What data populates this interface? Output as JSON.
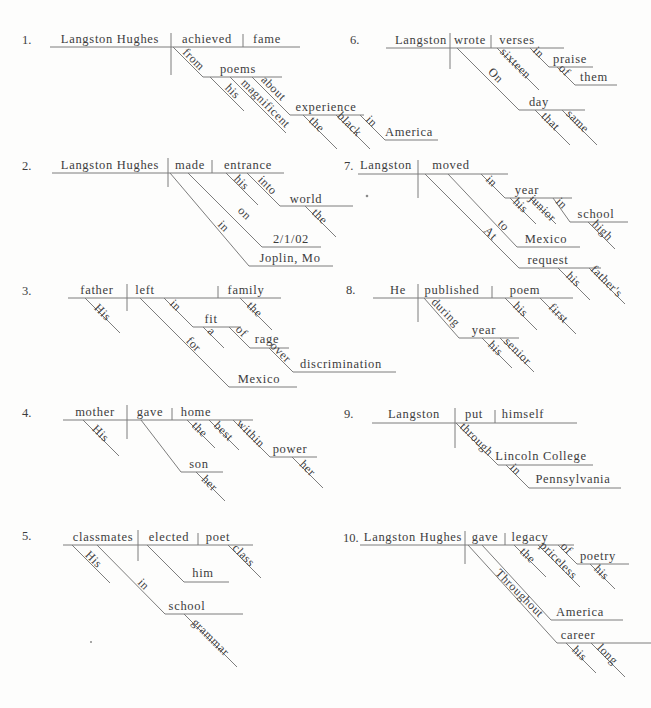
{
  "page": {
    "background": "#fdfdfc",
    "text_color": "#3c3c3c",
    "line_color": "#7d7d7d",
    "width": 651,
    "height": 708
  },
  "specks": [
    {
      "x": 367,
      "y": 196,
      "r": 1.3
    },
    {
      "x": 91,
      "y": 642,
      "r": 1.0
    }
  ],
  "diagrams": [
    {
      "number": "1.",
      "number_pos": [
        22,
        44
      ],
      "words": [
        [
          110,
          43,
          "Langston Hughes"
        ],
        [
          207,
          43,
          "achieved"
        ],
        [
          267,
          43,
          "fame"
        ],
        [
          238,
          73,
          "poems"
        ],
        [
          326,
          111,
          "experience"
        ],
        [
          409,
          136,
          "America"
        ]
      ],
      "slants": [
        [
          191,
          62,
          "from"
        ],
        [
          230,
          94,
          "his"
        ],
        [
          263,
          106,
          "magnificent"
        ],
        [
          271,
          91,
          "about"
        ],
        [
          314,
          127,
          "the"
        ],
        [
          347,
          127,
          "black"
        ],
        [
          369,
          124,
          "in"
        ]
      ],
      "lines": [
        [
          50,
          47,
          300,
          47
        ],
        [
          171,
          33,
          171,
          75
        ],
        [
          243,
          34,
          243,
          47
        ],
        [
          173,
          47,
          203,
          77
        ],
        [
          203,
          77,
          282,
          77
        ],
        [
          210,
          77,
          244,
          111
        ],
        [
          230,
          77,
          286,
          133
        ],
        [
          252,
          77,
          290,
          115
        ],
        [
          290,
          115,
          364,
          115
        ],
        [
          303,
          115,
          337,
          149
        ],
        [
          336,
          115,
          370,
          149
        ],
        [
          360,
          115,
          385,
          140
        ],
        [
          385,
          140,
          438,
          140
        ]
      ]
    },
    {
      "number": "2.",
      "number_pos": [
        22,
        170
      ],
      "words": [
        [
          110,
          169,
          "Langston Hughes"
        ],
        [
          190,
          169,
          "made"
        ],
        [
          248,
          169,
          "entrance"
        ],
        [
          306,
          203,
          "world"
        ],
        [
          291,
          243,
          "2/1/02"
        ],
        [
          290,
          262,
          "Joplin, Mo"
        ]
      ],
      "slants": [
        [
          239,
          185,
          "his"
        ],
        [
          265,
          188,
          "into"
        ],
        [
          317,
          219,
          "the"
        ],
        [
          242,
          216,
          "on"
        ],
        [
          221,
          229,
          "in"
        ]
      ],
      "lines": [
        [
          52,
          173,
          284,
          173
        ],
        [
          168,
          158,
          168,
          187
        ],
        [
          212,
          160,
          212,
          173
        ],
        [
          226,
          173,
          258,
          205
        ],
        [
          247,
          173,
          280,
          206
        ],
        [
          280,
          206,
          353,
          206
        ],
        [
          305,
          206,
          336,
          237
        ],
        [
          188,
          173,
          262,
          247
        ],
        [
          262,
          247,
          321,
          247
        ],
        [
          170,
          173,
          249,
          266
        ],
        [
          249,
          266,
          333,
          266
        ]
      ]
    },
    {
      "number": "3.",
      "number_pos": [
        22,
        295
      ],
      "words": [
        [
          97,
          294,
          "father"
        ],
        [
          145,
          294,
          "left"
        ],
        [
          246,
          294,
          "family"
        ],
        [
          211,
          323,
          "fit"
        ],
        [
          267,
          343,
          "rage"
        ],
        [
          341,
          368,
          "discrimination"
        ],
        [
          259,
          383,
          "Mexico"
        ]
      ],
      "slants": [
        [
          100,
          315,
          "His"
        ],
        [
          252,
          312,
          "the"
        ],
        [
          173,
          308,
          "in"
        ],
        [
          209,
          334,
          "a"
        ],
        [
          239,
          334,
          "of"
        ],
        [
          278,
          355,
          "over"
        ],
        [
          191,
          347,
          "for"
        ]
      ],
      "lines": [
        [
          68,
          298,
          281,
          298
        ],
        [
          127,
          284,
          127,
          311
        ],
        [
          218,
          286,
          218,
          298
        ],
        [
          85,
          298,
          120,
          333
        ],
        [
          240,
          298,
          272,
          330
        ],
        [
          164,
          298,
          193,
          327
        ],
        [
          193,
          327,
          241,
          327
        ],
        [
          203,
          327,
          224,
          348
        ],
        [
          229,
          327,
          250,
          348
        ],
        [
          250,
          348,
          289,
          348
        ],
        [
          269,
          348,
          293,
          372
        ],
        [
          293,
          372,
          396,
          372
        ],
        [
          140,
          298,
          229,
          387
        ],
        [
          229,
          387,
          297,
          387
        ]
      ]
    },
    {
      "number": "4.",
      "number_pos": [
        22,
        417
      ],
      "words": [
        [
          95,
          416,
          "mother"
        ],
        [
          150,
          416,
          "gave"
        ],
        [
          196,
          416,
          "home"
        ],
        [
          290,
          453,
          "power"
        ],
        [
          199,
          468,
          "son"
        ]
      ],
      "slants": [
        [
          98,
          436,
          "His"
        ],
        [
          197,
          432,
          "the"
        ],
        [
          221,
          434,
          "best"
        ],
        [
          248,
          436,
          "within"
        ],
        [
          305,
          471,
          "her"
        ],
        [
          207,
          486,
          "her"
        ]
      ],
      "lines": [
        [
          63,
          420,
          253,
          420
        ],
        [
          127,
          405,
          127,
          439
        ],
        [
          172,
          408,
          172,
          420
        ],
        [
          83,
          420,
          119,
          456
        ],
        [
          187,
          420,
          215,
          448
        ],
        [
          209,
          420,
          239,
          450
        ],
        [
          233,
          420,
          270,
          457
        ],
        [
          270,
          457,
          317,
          457
        ],
        [
          292,
          457,
          323,
          488
        ],
        [
          141,
          420,
          181,
          472
        ],
        [
          181,
          472,
          223,
          472
        ],
        [
          196,
          472,
          225,
          501
        ]
      ]
    },
    {
      "number": "5.",
      "number_pos": [
        22,
        540
      ],
      "words": [
        [
          103,
          541,
          "classmates"
        ],
        [
          169,
          541,
          "elected"
        ],
        [
          218,
          541,
          "poet"
        ],
        [
          203,
          577,
          "him"
        ],
        [
          187,
          610,
          "school"
        ]
      ],
      "slants": [
        [
          91,
          562,
          "His"
        ],
        [
          141,
          587,
          "in"
        ],
        [
          241,
          558,
          "class"
        ],
        [
          208,
          640,
          "grammar"
        ]
      ],
      "lines": [
        [
          63,
          545,
          253,
          545
        ],
        [
          138,
          530,
          138,
          561
        ],
        [
          198,
          533,
          198,
          545
        ],
        [
          72,
          545,
          110,
          583
        ],
        [
          97,
          545,
          165,
          614
        ],
        [
          165,
          614,
          243,
          614
        ],
        [
          184,
          614,
          237,
          667
        ],
        [
          147,
          545,
          184,
          582
        ],
        [
          184,
          582,
          229,
          582
        ],
        [
          228,
          545,
          261,
          578
        ]
      ]
    },
    {
      "number": "6.",
      "number_pos": [
        350,
        44
      ],
      "words": [
        [
          421,
          44,
          "Langston"
        ],
        [
          470,
          44,
          "wrote"
        ],
        [
          517,
          44,
          "verses"
        ],
        [
          570,
          63,
          "praise"
        ],
        [
          594,
          81,
          "them"
        ],
        [
          539,
          106,
          "day"
        ]
      ],
      "slants": [
        [
          513,
          66,
          "sixteen"
        ],
        [
          536,
          55,
          "in"
        ],
        [
          562,
          73,
          "of"
        ],
        [
          493,
          78,
          "On"
        ],
        [
          548,
          124,
          "that"
        ],
        [
          575,
          124,
          "same"
        ]
      ],
      "lines": [
        [
          386,
          48,
          564,
          48
        ],
        [
          450,
          33,
          450,
          69
        ],
        [
          491,
          35,
          491,
          48
        ],
        [
          497,
          48,
          539,
          90
        ],
        [
          530,
          48,
          549,
          67
        ],
        [
          549,
          67,
          593,
          67
        ],
        [
          557,
          67,
          575,
          85
        ],
        [
          575,
          85,
          617,
          85
        ],
        [
          457,
          48,
          519,
          110
        ],
        [
          519,
          110,
          585,
          110
        ],
        [
          535,
          110,
          570,
          145
        ],
        [
          562,
          110,
          597,
          145
        ]
      ]
    },
    {
      "number": "7.",
      "number_pos": [
        344,
        170
      ],
      "words": [
        [
          386,
          169,
          "Langston"
        ],
        [
          451,
          169,
          "moved"
        ],
        [
          527,
          194,
          "year"
        ],
        [
          596,
          218,
          "school"
        ],
        [
          546,
          243,
          "Mexico"
        ],
        [
          548,
          264,
          "request"
        ]
      ],
      "slants": [
        [
          489,
          184,
          "in"
        ],
        [
          518,
          208,
          "his"
        ],
        [
          540,
          211,
          "junior"
        ],
        [
          559,
          206,
          "in"
        ],
        [
          600,
          233,
          "high"
        ],
        [
          501,
          228,
          "to"
        ],
        [
          488,
          236,
          "At"
        ],
        [
          571,
          282,
          "his"
        ],
        [
          604,
          284,
          "father's"
        ]
      ],
      "lines": [
        [
          358,
          174,
          508,
          174
        ],
        [
          418,
          160,
          418,
          198
        ],
        [
          481,
          174,
          505,
          198
        ],
        [
          505,
          198,
          572,
          198
        ],
        [
          510,
          198,
          536,
          224
        ],
        [
          530,
          198,
          556,
          224
        ],
        [
          553,
          198,
          570,
          222
        ],
        [
          570,
          222,
          628,
          222
        ],
        [
          588,
          222,
          615,
          249
        ],
        [
          448,
          174,
          517,
          247
        ],
        [
          517,
          247,
          580,
          247
        ],
        [
          425,
          174,
          519,
          268
        ],
        [
          519,
          268,
          601,
          268
        ],
        [
          558,
          268,
          590,
          300
        ],
        [
          589,
          268,
          625,
          304
        ]
      ]
    },
    {
      "number": "8.",
      "number_pos": [
        346,
        294
      ],
      "words": [
        [
          398,
          294,
          "He"
        ],
        [
          452,
          294,
          "published"
        ],
        [
          525,
          294,
          "poem"
        ],
        [
          484,
          334,
          "year"
        ]
      ],
      "slants": [
        [
          518,
          312,
          "his"
        ],
        [
          556,
          316,
          "first"
        ],
        [
          443,
          315,
          "during"
        ],
        [
          493,
          351,
          "his"
        ],
        [
          515,
          354,
          "senior"
        ]
      ],
      "lines": [
        [
          373,
          298,
          573,
          298
        ],
        [
          418,
          284,
          418,
          322
        ],
        [
          492,
          286,
          492,
          298
        ],
        [
          505,
          298,
          537,
          330
        ],
        [
          540,
          298,
          576,
          334
        ],
        [
          424,
          298,
          459,
          338
        ],
        [
          459,
          338,
          519,
          338
        ],
        [
          482,
          338,
          512,
          368
        ],
        [
          500,
          338,
          534,
          372
        ]
      ]
    },
    {
      "number": "9.",
      "number_pos": [
        344,
        418
      ],
      "words": [
        [
          414,
          418,
          "Langston"
        ],
        [
          474,
          418,
          "put"
        ],
        [
          523,
          418,
          "himself"
        ],
        [
          541,
          460,
          "Lincoln College"
        ],
        [
          573,
          483,
          "Pennsylvania"
        ]
      ],
      "slants": [
        [
          474,
          442,
          "through"
        ],
        [
          513,
          472,
          "in"
        ]
      ],
      "lines": [
        [
          372,
          423,
          577,
          423
        ],
        [
          455,
          408,
          455,
          448
        ],
        [
          495,
          410,
          495,
          423
        ],
        [
          456,
          423,
          498,
          465
        ],
        [
          498,
          465,
          593,
          465
        ],
        [
          506,
          465,
          529,
          488
        ],
        [
          529,
          488,
          621,
          488
        ]
      ]
    },
    {
      "number": "10.",
      "number_pos": [
        343,
        542
      ],
      "words": [
        [
          413,
          541,
          "Langston Hughes"
        ],
        [
          485,
          541,
          "gave"
        ],
        [
          530,
          541,
          "legacy"
        ],
        [
          598,
          560,
          "poetry"
        ],
        [
          580,
          616,
          "America"
        ],
        [
          578,
          639,
          "career"
        ]
      ],
      "slants": [
        [
          525,
          558,
          "the"
        ],
        [
          556,
          563,
          "priceless"
        ],
        [
          564,
          551,
          "of"
        ],
        [
          599,
          575,
          "his"
        ],
        [
          517,
          596,
          "Throughout"
        ],
        [
          577,
          656,
          "his"
        ],
        [
          605,
          657,
          "long"
        ]
      ],
      "lines": [
        [
          360,
          545,
          574,
          545
        ],
        [
          465,
          531,
          465,
          564
        ],
        [
          505,
          533,
          505,
          545
        ],
        [
          514,
          545,
          546,
          577
        ],
        [
          538,
          545,
          580,
          587
        ],
        [
          558,
          545,
          577,
          564
        ],
        [
          577,
          564,
          629,
          564
        ],
        [
          590,
          564,
          615,
          589
        ],
        [
          482,
          545,
          551,
          620
        ],
        [
          551,
          620,
          623,
          620
        ],
        [
          468,
          545,
          557,
          643
        ],
        [
          557,
          643,
          652,
          643
        ],
        [
          566,
          643,
          596,
          673
        ],
        [
          591,
          643,
          625,
          677
        ]
      ]
    }
  ]
}
